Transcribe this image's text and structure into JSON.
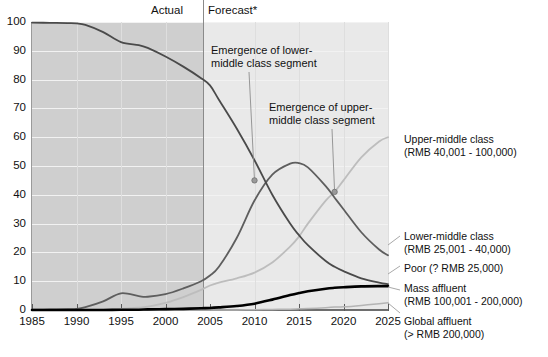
{
  "header": {
    "actual_label": "Actual",
    "forecast_label": "Forecast*"
  },
  "annotations": [
    {
      "id": "lower-middle",
      "line1": "Emergence of lower-",
      "line2": "middle class segment",
      "point_year": 2010,
      "point_value": 45
    },
    {
      "id": "upper-middle",
      "line1": "Emergence of upper-",
      "line2": "middle class segment",
      "point_year": 2019,
      "point_value": 41
    }
  ],
  "legend": {
    "upper_middle": {
      "name": "Upper-middle class",
      "range": "(RMB 40,001 - 100,000)"
    },
    "lower_middle": {
      "name": "Lower-middle class",
      "range": "(RMB 25,001 - 40,000)"
    },
    "poor": {
      "name": "Poor (? RMB 25,000)",
      "range": ""
    },
    "mass_affluent": {
      "name": "Mass affluent",
      "range": "(RMB 100,001 - 200,000)"
    },
    "global_affluent": {
      "name": "Global affluent",
      "range": "(> RMB 200,000)"
    }
  },
  "footnote": "",
  "colors": {
    "band_actual": "#cfcfcf",
    "band_forecast": "#e9e9e9",
    "poor": "#4a4a4a",
    "lower_middle": "#5e5e5e",
    "upper_middle": "#bdbdbd",
    "mass_affluent": "#000000",
    "global_affluent": "#b4b4b4",
    "divider": "#8a8a8a",
    "gridline": "#f2f2f2"
  },
  "chart_data": {
    "type": "line",
    "title": "",
    "subtitle": "",
    "xlabel": "",
    "ylabel": "",
    "xlim": [
      1985,
      2025
    ],
    "ylim": [
      0,
      100
    ],
    "xticks": [
      1985,
      1990,
      1995,
      2000,
      2005,
      2010,
      2015,
      2020,
      2025
    ],
    "yticks": [
      0,
      10,
      20,
      30,
      40,
      50,
      60,
      70,
      80,
      90,
      100
    ],
    "xtick_labels": [
      "1985",
      "1990",
      "1995",
      "2000",
      "2005",
      "2010",
      "2015",
      "2020",
      "2025"
    ],
    "ytick_labels": [
      "0",
      "10",
      "20",
      "30",
      "40",
      "50",
      "60",
      "70",
      "80",
      "90",
      "100"
    ],
    "grid": true,
    "legend_position": "right-outside",
    "actual_forecast_split_year": 2005,
    "regions": [
      {
        "label": "Actual",
        "from": 1985,
        "to": 2005,
        "shade": "#cfcfcf"
      },
      {
        "label": "Forecast*",
        "from": 2005,
        "to": 2025,
        "shade": "#e9e9e9"
      }
    ],
    "x": [
      1985,
      1987,
      1989,
      1990,
      1991,
      1993,
      1995,
      1997,
      1998,
      2000,
      2002,
      2004,
      2005,
      2006,
      2008,
      2010,
      2012,
      2014,
      2015,
      2016,
      2018,
      2019,
      2020,
      2022,
      2024,
      2025
    ],
    "series": [
      {
        "name": "Poor (? RMB 25,000)",
        "key": "poor",
        "color": "#4a4a4a",
        "values": [
          99.8,
          99.7,
          99.6,
          99.5,
          99.0,
          96.5,
          93.0,
          92.0,
          91.0,
          88.0,
          84.5,
          80.5,
          78.0,
          73.0,
          63.0,
          52.0,
          40.0,
          30.0,
          26.0,
          22.5,
          17.0,
          15.0,
          13.5,
          11.0,
          9.5,
          9.0
        ]
      },
      {
        "name": "Lower-middle class (RMB 25,001 - 40,000)",
        "key": "lower_middle",
        "color": "#5e5e5e",
        "values": [
          0.1,
          0.2,
          0.3,
          0.4,
          1.0,
          3.0,
          5.8,
          4.8,
          4.6,
          5.5,
          7.5,
          10.0,
          12.0,
          15.0,
          25.0,
          38.0,
          47.0,
          50.8,
          51.0,
          49.5,
          43.0,
          39.0,
          35.0,
          27.0,
          21.0,
          19.0
        ]
      },
      {
        "name": "Upper-middle class (RMB 40,001 - 100,000)",
        "key": "upper_middle",
        "color": "#bdbdbd",
        "values": [
          0.0,
          0.0,
          0.0,
          0.0,
          0.1,
          0.2,
          0.4,
          0.8,
          1.2,
          2.5,
          4.5,
          7.0,
          8.5,
          9.5,
          11.0,
          13.0,
          16.5,
          22.0,
          25.5,
          30.0,
          38.0,
          41.0,
          45.0,
          53.0,
          58.5,
          60.0
        ]
      },
      {
        "name": "Mass affluent (RMB 100,001 - 200,000)",
        "key": "mass_affluent",
        "color": "#000000",
        "values": [
          0.0,
          0.0,
          0.0,
          0.0,
          0.0,
          0.0,
          0.1,
          0.1,
          0.2,
          0.3,
          0.4,
          0.6,
          0.7,
          0.9,
          1.4,
          2.2,
          3.6,
          5.2,
          5.9,
          6.5,
          7.4,
          7.7,
          7.9,
          8.2,
          8.3,
          8.3
        ]
      },
      {
        "name": "Global affluent (> RMB 200,000)",
        "key": "global_affluent",
        "color": "#b4b4b4",
        "values": [
          0.0,
          0.0,
          0.0,
          0.0,
          0.0,
          0.0,
          0.0,
          0.0,
          0.0,
          0.0,
          0.0,
          0.0,
          0.0,
          0.0,
          0.0,
          0.1,
          0.2,
          0.3,
          0.4,
          0.5,
          0.8,
          1.0,
          1.1,
          1.6,
          2.2,
          2.5
        ]
      }
    ]
  }
}
